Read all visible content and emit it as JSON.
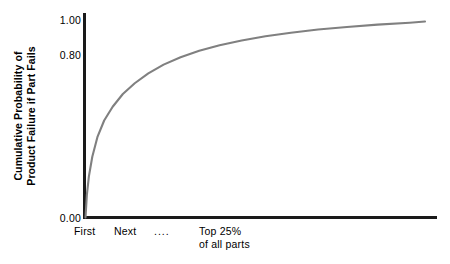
{
  "chart_data": {
    "type": "line",
    "title": "",
    "xlabel": "",
    "ylabel": "Cumulative Probability of Product Failure if Part Fails",
    "ylabel_lines": [
      "Cumulative Probability of",
      "Product Failure if Part Fails"
    ],
    "ylim": [
      0.0,
      1.05
    ],
    "yticks": [
      "0.00",
      "0.80",
      "1.00"
    ],
    "ytick_values": [
      0.0,
      0.8,
      1.0
    ],
    "xticks": [
      "First",
      "Next",
      "....",
      "Top 25%"
    ],
    "xtick_labels": [
      {
        "label": "First",
        "sub": ""
      },
      {
        "label": "Next",
        "sub": ""
      },
      {
        "label": "....",
        "sub": ""
      },
      {
        "label": "Top 25%",
        "sub": "of all parts"
      }
    ],
    "grid": false,
    "legend": null,
    "series": [
      {
        "name": "Cumulative failure probability",
        "color": "#808080",
        "x": [
          0.0,
          0.004,
          0.01,
          0.02,
          0.035,
          0.055,
          0.08,
          0.11,
          0.145,
          0.185,
          0.23,
          0.28,
          0.335,
          0.395,
          0.46,
          0.53,
          0.605,
          0.685,
          0.77,
          0.86,
          0.955,
          1.0
        ],
        "y": [
          0.0,
          0.115,
          0.21,
          0.31,
          0.41,
          0.495,
          0.565,
          0.63,
          0.685,
          0.735,
          0.78,
          0.818,
          0.851,
          0.879,
          0.903,
          0.925,
          0.943,
          0.959,
          0.972,
          0.984,
          0.994,
          1.0
        ]
      }
    ],
    "axis_color": "#1a1a1a",
    "curve_color": "#808080",
    "background": "#ffffff"
  },
  "axes": {
    "y_title_line1": "Cumulative Probability of",
    "y_title_line2": "Product Failure if Part Fails",
    "ytick_0": "1.00",
    "ytick_1": "0.80",
    "ytick_2": "0.00",
    "xtick_0": "First",
    "xtick_1": "Next",
    "xtick_2": "....",
    "xtick_3_line1": "Top 25%",
    "xtick_3_line2": "of all parts"
  }
}
